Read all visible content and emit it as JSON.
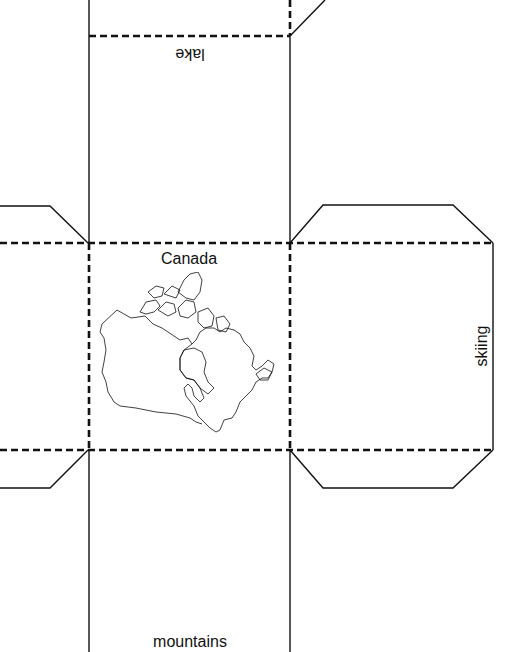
{
  "template": {
    "type": "cube net",
    "line_color": "#111111",
    "background": "#ffffff"
  },
  "faces": {
    "top": {
      "label": "lake",
      "orientation": "upside-down"
    },
    "center": {
      "label": "Canada",
      "image": "canada-map-outline"
    },
    "right": {
      "label": "skiing",
      "orientation": "rotated-90-ccw"
    },
    "bottom": {
      "label": "mountains"
    }
  }
}
